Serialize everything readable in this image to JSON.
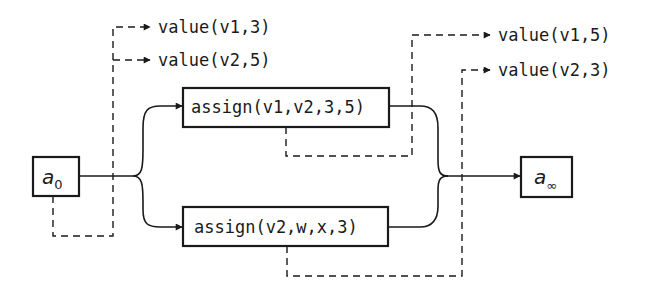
{
  "diagram": {
    "colors": {
      "ink": "#1a1a1a",
      "background": "#ffffff"
    },
    "initial_state": {
      "base": "a",
      "subscript": "0"
    },
    "final_state": {
      "base": "a",
      "subscript": "∞"
    },
    "actions": [
      {
        "label": "assign(v1,v2,3,5)"
      },
      {
        "label": "assign(v2,w,x,3)"
      }
    ],
    "initial_observations": [
      {
        "label": "value(v1,3)"
      },
      {
        "label": "value(v2,5)"
      }
    ],
    "final_observations": [
      {
        "label": "value(v1,5)"
      },
      {
        "label": "value(v2,3)"
      }
    ],
    "edge_styles": {
      "solid": "action flow",
      "dashed": "observation / effect link"
    }
  }
}
